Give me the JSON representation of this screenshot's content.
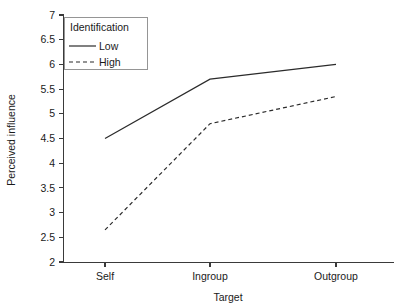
{
  "chart_data": {
    "type": "line",
    "title": "",
    "xlabel": "Target",
    "ylabel": "Perceived influence",
    "categories": [
      "Self",
      "Ingroup",
      "Outgroup"
    ],
    "series": [
      {
        "name": "Low",
        "style": "solid",
        "values": [
          4.5,
          5.7,
          6.0
        ]
      },
      {
        "name": "High",
        "style": "dashed",
        "values": [
          2.65,
          4.8,
          5.35
        ]
      }
    ],
    "ylim": [
      2,
      7
    ],
    "yticks": [
      2,
      2.5,
      3,
      3.5,
      4,
      4.5,
      5,
      5.5,
      6,
      6.5,
      7
    ],
    "ytick_labels": [
      "2",
      "2.5",
      "3",
      "3.5",
      "4",
      "4.5",
      "5",
      "5.5",
      "6",
      "6.5",
      "7"
    ],
    "grid": false,
    "legend": {
      "position": "top-left",
      "title": "Identification",
      "entries": [
        {
          "label": "Low",
          "style": "solid"
        },
        {
          "label": "High",
          "style": "dashed"
        }
      ]
    },
    "colors": {
      "line": "#2b2b2b",
      "axis": "#3a3a3a",
      "text": "#1a1a1a",
      "background": "#ffffff",
      "legend_border": "#8a8a8a"
    }
  }
}
